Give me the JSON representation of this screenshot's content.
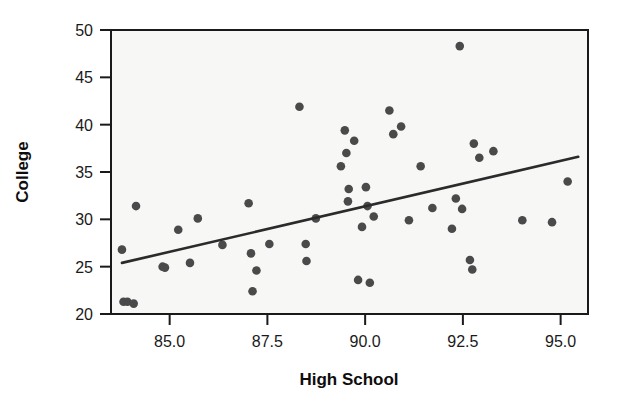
{
  "chart_data": {
    "type": "scatter",
    "title": "",
    "xlabel": "High School",
    "ylabel": "College",
    "xlim": [
      83.5,
      95.7
    ],
    "ylim": [
      20,
      50
    ],
    "xticks": [
      85.0,
      87.5,
      90.0,
      92.5,
      95.0
    ],
    "xticklabels": [
      "85.0",
      "87.5",
      "90.0",
      "92.5",
      "95.0"
    ],
    "yticks": [
      20,
      25,
      30,
      35,
      40,
      45,
      50
    ],
    "yticklabels": [
      "20",
      "25",
      "30",
      "35",
      "40",
      "45",
      "50"
    ],
    "grid": false,
    "legend": null,
    "point_color": "#4a4a4a",
    "line_color": "#2b2b2b",
    "panel_color": "#f7f7f5",
    "points": [
      {
        "x": 83.78,
        "y": 26.8
      },
      {
        "x": 83.82,
        "y": 21.3
      },
      {
        "x": 83.92,
        "y": 21.3
      },
      {
        "x": 84.08,
        "y": 21.1
      },
      {
        "x": 84.14,
        "y": 31.4
      },
      {
        "x": 84.82,
        "y": 25.0
      },
      {
        "x": 84.88,
        "y": 24.9
      },
      {
        "x": 85.22,
        "y": 28.9
      },
      {
        "x": 85.52,
        "y": 25.4
      },
      {
        "x": 85.72,
        "y": 30.1
      },
      {
        "x": 86.35,
        "y": 27.3
      },
      {
        "x": 87.02,
        "y": 31.7
      },
      {
        "x": 87.08,
        "y": 26.4
      },
      {
        "x": 87.12,
        "y": 22.4
      },
      {
        "x": 87.22,
        "y": 24.6
      },
      {
        "x": 87.55,
        "y": 27.4
      },
      {
        "x": 88.32,
        "y": 41.9
      },
      {
        "x": 88.48,
        "y": 27.4
      },
      {
        "x": 88.5,
        "y": 25.6
      },
      {
        "x": 88.74,
        "y": 30.1
      },
      {
        "x": 89.38,
        "y": 35.6
      },
      {
        "x": 89.48,
        "y": 39.4
      },
      {
        "x": 89.52,
        "y": 37.0
      },
      {
        "x": 89.56,
        "y": 31.9
      },
      {
        "x": 89.58,
        "y": 33.2
      },
      {
        "x": 89.72,
        "y": 38.3
      },
      {
        "x": 89.82,
        "y": 23.6
      },
      {
        "x": 89.92,
        "y": 29.2
      },
      {
        "x": 90.02,
        "y": 33.4
      },
      {
        "x": 90.06,
        "y": 31.4
      },
      {
        "x": 90.12,
        "y": 23.3
      },
      {
        "x": 90.22,
        "y": 30.3
      },
      {
        "x": 90.62,
        "y": 41.5
      },
      {
        "x": 90.72,
        "y": 39.0
      },
      {
        "x": 90.92,
        "y": 39.8
      },
      {
        "x": 91.12,
        "y": 29.9
      },
      {
        "x": 91.42,
        "y": 35.6
      },
      {
        "x": 91.72,
        "y": 31.2
      },
      {
        "x": 92.22,
        "y": 29.0
      },
      {
        "x": 92.32,
        "y": 32.2
      },
      {
        "x": 92.42,
        "y": 48.3
      },
      {
        "x": 92.48,
        "y": 31.1
      },
      {
        "x": 92.68,
        "y": 25.7
      },
      {
        "x": 92.74,
        "y": 24.7
      },
      {
        "x": 92.78,
        "y": 38.0
      },
      {
        "x": 92.92,
        "y": 36.5
      },
      {
        "x": 93.28,
        "y": 37.2
      },
      {
        "x": 94.02,
        "y": 29.9
      },
      {
        "x": 94.78,
        "y": 29.7
      },
      {
        "x": 95.18,
        "y": 34.0
      }
    ],
    "trend_line": {
      "x_start": 83.78,
      "y_start": 25.4,
      "x_end": 95.45,
      "y_end": 36.6
    }
  }
}
